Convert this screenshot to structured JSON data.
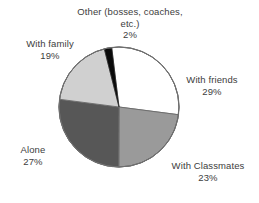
{
  "chart_data": {
    "type": "pie",
    "title": "",
    "subtitle": "",
    "xlabel": "",
    "ylabel": "",
    "legend_position": "none",
    "grid": false,
    "labels_show_percent": true,
    "start_angle_deg": -7,
    "direction": "clockwise",
    "categories": [
      "With friends",
      "With Classmates",
      "Alone",
      "With family",
      "Other (bosses, coaches, etc.)"
    ],
    "values": [
      29,
      23,
      27,
      19,
      2
    ],
    "value_labels": [
      "29%",
      "23%",
      "27%",
      "19%",
      "2%"
    ],
    "colors": [
      "#ffffff",
      "#9a9a9a",
      "#575757",
      "#d0d0d0",
      "#0a0a0a"
    ],
    "slices": [
      {
        "name": "With friends",
        "value": 29,
        "value_label": "29%",
        "color": "#ffffff",
        "start_deg": -7,
        "end_deg": 97.4
      },
      {
        "name": "With Classmates",
        "value": 23,
        "value_label": "23%",
        "color": "#9a9a9a",
        "start_deg": 97.4,
        "end_deg": 180.2
      },
      {
        "name": "Alone",
        "value": 27,
        "value_label": "27%",
        "color": "#575757",
        "start_deg": 180.2,
        "end_deg": 277.4
      },
      {
        "name": "With family",
        "value": 19,
        "value_label": "19%",
        "color": "#d0d0d0",
        "start_deg": 277.4,
        "end_deg": 345.8
      },
      {
        "name": "Other (bosses, coaches, etc.)",
        "value": 2,
        "value_label": "2%",
        "color": "#0a0a0a",
        "start_deg": 345.8,
        "end_deg": 353.0
      }
    ],
    "outline_color": "#6b6b6b",
    "total": 100
  },
  "labels": {
    "other": {
      "name": "Other (bosses, coaches, etc.)",
      "value": "2%"
    },
    "family": {
      "name": "With family",
      "value": "19%"
    },
    "alone": {
      "name": "Alone",
      "value": "27%"
    },
    "friends": {
      "name": "With friends",
      "value": "29%"
    },
    "classmates": {
      "name": "With Classmates",
      "value": "23%"
    }
  }
}
